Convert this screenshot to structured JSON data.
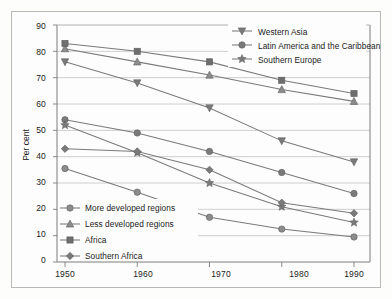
{
  "chart_data": {
    "type": "line",
    "title": "",
    "subtitle": "",
    "xlabel": "",
    "ylabel": "Per cent",
    "x": [
      1950,
      1960,
      1970,
      1980,
      1990
    ],
    "xtick_labels": [
      "1950",
      "1960",
      "1970",
      "1980",
      "1990"
    ],
    "ytick_labels": [
      "0",
      "10",
      "20",
      "30",
      "40",
      "50",
      "60",
      "70",
      "80",
      "90"
    ],
    "ylim": [
      0,
      90
    ],
    "ytick_step": 10,
    "grid": "horizontal",
    "legend_position": "inside-top-right and inside-bottom-left",
    "series": [
      {
        "name": "Western Asia",
        "marker": "triangle-down",
        "color": "#7a7a7a",
        "values": [
          76,
          68,
          58.5,
          46,
          38
        ]
      },
      {
        "name": "Latin America and the Caribbean",
        "marker": "circle",
        "color": "#7a7a7a",
        "values": [
          54,
          49,
          42,
          34,
          26
        ]
      },
      {
        "name": "Southern Europe",
        "marker": "star",
        "color": "#7a7a7a",
        "values": [
          52,
          41.5,
          30,
          21,
          15
        ]
      },
      {
        "name": "More developed regions",
        "marker": "circle",
        "color": "#8c8c8c",
        "values": [
          35.5,
          26.5,
          17,
          12.5,
          9.5
        ]
      },
      {
        "name": "Less developed regions",
        "marker": "triangle-up",
        "color": "#8c8c8c",
        "values": [
          81,
          76,
          71,
          65.5,
          61
        ]
      },
      {
        "name": "Africa",
        "marker": "square",
        "color": "#6e6e6e",
        "values": [
          83,
          80,
          76,
          69,
          64
        ]
      },
      {
        "name": "Southern Africa",
        "marker": "diamond",
        "color": "#7a7a7a",
        "values": [
          43,
          42,
          35,
          22.5,
          18.5
        ]
      }
    ]
  },
  "legend_top": {
    "items": [
      {
        "label": "Western Asia",
        "marker": "triangle-down"
      },
      {
        "label": "Latin America and the Caribbean",
        "marker": "circle"
      },
      {
        "label": "Southern Europe",
        "marker": "star"
      }
    ]
  },
  "legend_bottom": {
    "items": [
      {
        "label": "More developed regions",
        "marker": "circle"
      },
      {
        "label": "Less developed regions",
        "marker": "triangle-up"
      },
      {
        "label": "Africa",
        "marker": "square"
      },
      {
        "label": "Southern Africa",
        "marker": "diamond"
      }
    ]
  },
  "colors": {
    "line": "#7a7a7a",
    "grid": "#c2c2c2",
    "axis": "#7d7d7d",
    "text": "#1a1a1a",
    "frame": "#b9b9b7",
    "background": "#fdfdfd"
  }
}
